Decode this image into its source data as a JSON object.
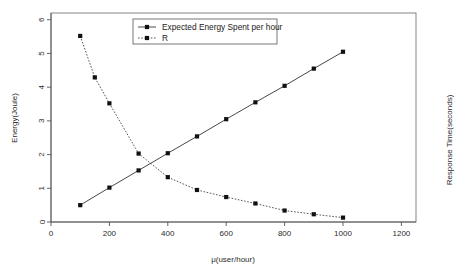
{
  "chart_data": {
    "type": "line",
    "title": "",
    "xlabel": "μ(user/hour)",
    "ylabel": "Energy(Joule)",
    "y2label": "Response Time(seconds)",
    "xlim": [
      0,
      1250
    ],
    "ylim": [
      0,
      6.2
    ],
    "xticks": [
      0,
      200,
      400,
      600,
      800,
      1000,
      1200
    ],
    "xtick_labels": [
      "0",
      "200",
      "400",
      "600",
      "800",
      "1000",
      "1200"
    ],
    "yticks": [
      0,
      1,
      2,
      3,
      4,
      5,
      6
    ],
    "ytick_labels": [
      "0",
      "1",
      "2",
      "3",
      "4",
      "5",
      "6"
    ],
    "grid": false,
    "legend_position": "top-center",
    "series": [
      {
        "name": "Expected Energy Spent per hour",
        "style": "solid",
        "marker": "square",
        "x": [
          100,
          200,
          300,
          400,
          500,
          600,
          700,
          800,
          900,
          1000
        ],
        "values": [
          0.5,
          1.02,
          1.53,
          2.04,
          2.54,
          3.05,
          3.55,
          4.04,
          4.55,
          5.05
        ]
      },
      {
        "name": "R",
        "style": "dashed",
        "marker": "square",
        "x": [
          100,
          150,
          200,
          300,
          400,
          500,
          600,
          700,
          800,
          900,
          1000
        ],
        "values": [
          5.52,
          4.29,
          3.52,
          2.03,
          1.33,
          0.95,
          0.74,
          0.55,
          0.34,
          0.23,
          0.13
        ]
      }
    ],
    "legend": [
      {
        "label": "Expected Energy Spent per hour",
        "style": "solid",
        "marker": "square"
      },
      {
        "label": "R",
        "style": "dashed",
        "marker": "square"
      }
    ],
    "colors": {
      "series_1": "#333333",
      "series_2": "#444444",
      "axis": "#555555",
      "text": "#2b2b2b",
      "background": "#ffffff"
    }
  }
}
